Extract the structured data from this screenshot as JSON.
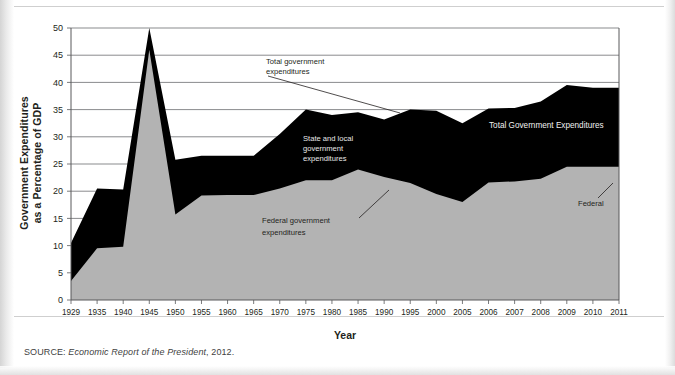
{
  "figure": {
    "ylabel": "Government Expenditures as a Percentage of GDP",
    "ylabel_line1": "Government Expenditures",
    "ylabel_line2": "as a Percentage of GDP",
    "xlabel": "Year",
    "source_prefix": "SOURCE: ",
    "source_title": "Economic Report of the President",
    "source_suffix": ", 2012."
  },
  "annotations": {
    "total_callout_line1": "Total government",
    "total_callout_line2": "expenditures",
    "state_local_line1": "State and local",
    "state_local_line2": "government",
    "state_local_line3": "expenditures",
    "federal_callout_line1": "Federal government",
    "federal_callout_line2": "expenditures",
    "total_inside": "Total Government Expenditures",
    "federal_inside": "Federal"
  },
  "colors": {
    "total_area": "#000000",
    "federal_area": "#b3b3b3",
    "axis": "#58595b",
    "grid": "#58595b",
    "text": "#231f20",
    "light_text": "#e8e8e8",
    "page": "#ffffff"
  },
  "chart_data": {
    "type": "area",
    "title": "",
    "xlabel": "Year",
    "ylabel": "Government Expenditures as a Percentage of GDP",
    "grid": true,
    "legend_position": "inline-annotations",
    "ylim": [
      0,
      50
    ],
    "yticks": [
      0,
      5,
      10,
      15,
      20,
      25,
      30,
      35,
      40,
      45,
      50
    ],
    "categories": [
      "1929",
      "1935",
      "1940",
      "1945",
      "1950",
      "1955",
      "1960",
      "1965",
      "1970",
      "1975",
      "1980",
      "1985",
      "1990",
      "1995",
      "2000",
      "2005",
      "2006",
      "2007",
      "2008",
      "2009",
      "2010",
      "2011"
    ],
    "series": [
      {
        "name": "Total government expenditures",
        "color": "#000000",
        "values": [
          10.5,
          20.5,
          20.3,
          50.0,
          25.8,
          26.5,
          26.5,
          26.5,
          30.5,
          35.0,
          34.0,
          34.5,
          33.2,
          35.0,
          34.8,
          32.5,
          35.2,
          35.3,
          36.5,
          39.5,
          39.0,
          39.0
        ]
      },
      {
        "name": "Federal government expenditures",
        "color": "#b3b3b3",
        "values": [
          3.5,
          9.5,
          9.8,
          46.0,
          15.7,
          19.2,
          19.3,
          19.3,
          20.5,
          22.0,
          22.0,
          24.0,
          22.6,
          21.5,
          19.5,
          18.0,
          21.6,
          21.8,
          22.3,
          24.5,
          24.5,
          24.5
        ]
      }
    ]
  }
}
